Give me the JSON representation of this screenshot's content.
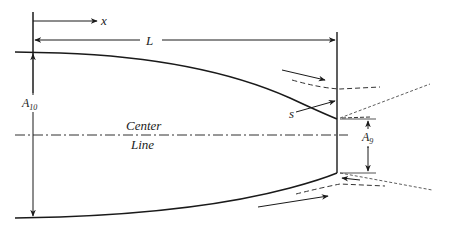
{
  "diagram": {
    "labels": {
      "x_axis": "x",
      "length": "L",
      "inlet_area": "A",
      "inlet_area_sub": "10",
      "exit_area": "A",
      "exit_area_sub": "9",
      "separation_point": "s",
      "center_line_1": "Center",
      "center_line_2": "Line"
    },
    "colors": {
      "stroke": "#1a1a1a",
      "dash": "#333333"
    }
  }
}
